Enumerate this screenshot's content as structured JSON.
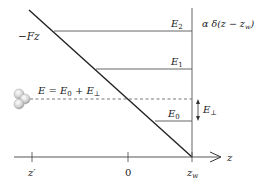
{
  "diagram": {
    "type": "energy-level diagram",
    "potential_label": "−Fz",
    "wall_label": "α δ(z − z",
    "wall_label_sub": "w",
    "wall_label_close": ")",
    "levels": [
      {
        "name": "E",
        "sub": "2",
        "y": 31,
        "x_start": 54
      },
      {
        "name": "E",
        "sub": "1",
        "y": 69,
        "x_start": 96
      },
      {
        "name": "E",
        "sub": "0",
        "y": 121,
        "x_start": 155
      }
    ],
    "energy_label": {
      "E": "E = E",
      "E0_sub": "0",
      "plus": " + E",
      "perp_sub": "⊥"
    },
    "perp_arrow_label": {
      "text": "E",
      "sub": "⊥"
    },
    "axis": {
      "label": "z",
      "ticks": [
        {
          "label": "z′",
          "x": 32
        },
        {
          "label": "0",
          "x": 128
        },
        {
          "label": "z",
          "sub": "w",
          "x": 192
        }
      ]
    },
    "colors": {
      "line": "#222222",
      "level": "#555555",
      "atom": "#bbbbbb"
    }
  }
}
